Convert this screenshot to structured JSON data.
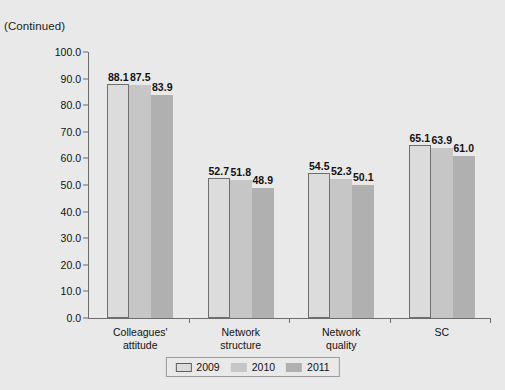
{
  "caption": "(Continued)",
  "chart_data": {
    "type": "bar",
    "title": "",
    "subtitle": "",
    "xlabel": "",
    "ylabel": "",
    "ylim": [
      0.0,
      100.0
    ],
    "ytick_step": 10.0,
    "grid": false,
    "legend_position": "bottom-center",
    "categories": [
      "Colleagues'\nattitude",
      "Network\nstructure",
      "Network\nquality",
      "SC"
    ],
    "ytick_labels": [
      "100.0",
      "90.0",
      "80.0",
      "70.0",
      "60.0",
      "50.0",
      "40.0",
      "30.0",
      "20.0",
      "10.0",
      "0.0"
    ],
    "ytick_values": [
      100.0,
      90.0,
      80.0,
      70.0,
      60.0,
      50.0,
      40.0,
      30.0,
      20.0,
      10.0,
      0.0
    ],
    "series": [
      {
        "name": "2009",
        "color": "#dcdcdc",
        "values": [
          88.1,
          87.5,
          52.7,
          51.8
        ],
        "labels": [
          "88.1",
          "52.7",
          "54.5",
          "65.1"
        ],
        "series_values": [
          88.1,
          52.7,
          54.5,
          65.1
        ]
      },
      {
        "name": "2010",
        "color": "#c6c6c6",
        "values": [
          87.5,
          51.8,
          52.3,
          63.9
        ],
        "labels": [
          "87.5",
          "51.8",
          "52.3",
          "63.9"
        ],
        "series_values": [
          87.5,
          51.8,
          52.3,
          63.9
        ]
      },
      {
        "name": "2011",
        "color": "#b0b0b0",
        "values": [
          83.9,
          48.9,
          50.1,
          61.0
        ],
        "labels": [
          "83.9",
          "48.9",
          "50.1",
          "61.0"
        ],
        "series_values": [
          83.9,
          48.9,
          50.1,
          61.0
        ]
      }
    ],
    "legend": [
      "2009",
      "2010",
      "2011"
    ]
  }
}
